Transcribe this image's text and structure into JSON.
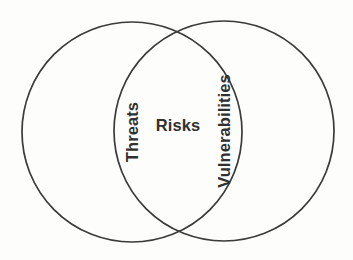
{
  "diagram": {
    "type": "venn",
    "title": "",
    "background_color": "#fdfdfc",
    "stroke_color": "#3a3a3a",
    "text_color": "#303030",
    "sets": [
      {
        "id": "threats",
        "label": "Threats",
        "position": "left",
        "orientation": "vertical-bottom-to-top",
        "center_x": 132,
        "center_y": 132,
        "radius": 110
      },
      {
        "id": "vulnerabilities",
        "label": "Vulnerabilities",
        "position": "right",
        "orientation": "vertical-bottom-to-top",
        "center_x": 224,
        "center_y": 131,
        "radius": 110
      }
    ],
    "intersection": {
      "id": "risks",
      "label": "Risks",
      "orientation": "horizontal",
      "center_x": 178,
      "center_y": 125
    }
  }
}
